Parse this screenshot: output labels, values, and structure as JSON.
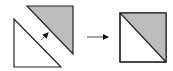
{
  "diagram": {
    "colors": {
      "background": "#ffffff",
      "stroke": "#222222",
      "shaded_fill": "#bdbdbd",
      "unshaded_fill": "#ffffff"
    },
    "left_group": {
      "shaded_triangle": {
        "points": "27,6 73,6 73,54",
        "fill": "shaded"
      },
      "white_triangle": {
        "points": "14,19 14,67 61,67",
        "fill": "unshaded"
      },
      "join_arrow": {
        "from": [
          41,
          40
        ],
        "to": [
          48,
          33
        ]
      }
    },
    "transition_arrow": {
      "from": [
        87,
        37
      ],
      "to": [
        108,
        37
      ]
    },
    "result_square": {
      "x": 120,
      "y": 13,
      "size": 46,
      "shaded_half": "upper-right",
      "diagonal": "top-left to bottom-right"
    }
  }
}
